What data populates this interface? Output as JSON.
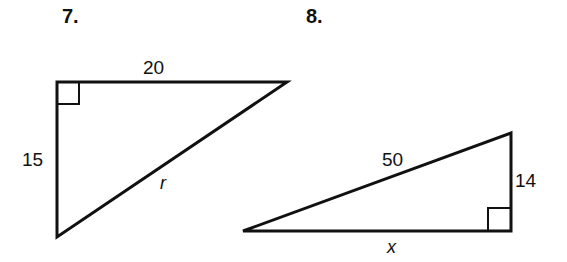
{
  "problems": [
    {
      "number": "7.",
      "shape": "right-triangle",
      "sides": {
        "top_leg": "20",
        "left_leg": "15",
        "hypotenuse": "r"
      },
      "right_angle": "top-left"
    },
    {
      "number": "8.",
      "shape": "right-triangle",
      "sides": {
        "hypotenuse": "50",
        "right_leg": "14",
        "bottom_leg": "x"
      },
      "right_angle": "bottom-right"
    }
  ],
  "colors": {
    "stroke": "#111111",
    "background": "#ffffff"
  }
}
